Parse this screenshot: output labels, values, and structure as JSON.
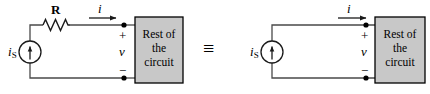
{
  "figure": {
    "type": "circuit-equivalence-diagram",
    "equivalence_symbol": "≡",
    "colors": {
      "wire": "#4a4a4a",
      "box_fill": "#c8c8c8",
      "box_border": "#000000",
      "text": "#000000",
      "node_dot": "#000000",
      "background": "#ffffff"
    }
  },
  "left_circuit": {
    "name": "practical-current-source",
    "source_label": "i",
    "source_subscript": "S",
    "resistor_label": "R",
    "current_label": "i",
    "voltage_label": "v",
    "plus_sign": "+",
    "minus_sign": "−",
    "block": {
      "line1": "Rest of",
      "line2": "the",
      "line3": "circuit"
    }
  },
  "right_circuit": {
    "name": "ideal-current-source",
    "source_label": "i",
    "source_subscript": "S",
    "current_label": "i",
    "voltage_label": "v",
    "plus_sign": "+",
    "minus_sign": "−",
    "block": {
      "line1": "Rest of",
      "line2": "the",
      "line3": "circuit"
    }
  }
}
